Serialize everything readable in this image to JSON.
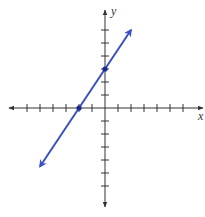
{
  "chart_data": {
    "type": "line",
    "title": "",
    "xlabel": "x",
    "ylabel": "y",
    "grid": false,
    "xlim": [
      -7,
      7
    ],
    "ylim": [
      -7,
      7
    ],
    "tick_spacing": 1,
    "series": [
      {
        "name": "line",
        "equation": "y = 1.5x + 3",
        "color": "#3a4fc4",
        "x": [
          -5,
          2
        ],
        "y": [
          -4.5,
          6
        ],
        "marked_points": [
          {
            "x": -2,
            "y": 0
          },
          {
            "x": 0,
            "y": 3
          }
        ]
      }
    ]
  },
  "labels": {
    "x": "x",
    "y": "y"
  },
  "colors": {
    "axis": "#333333",
    "line": "#3a4fc4",
    "point": "#1a2a8a"
  }
}
